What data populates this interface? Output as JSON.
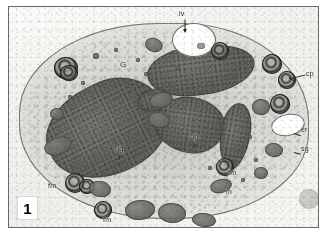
{
  "figure": {
    "number": "1",
    "type": "transmission-electron-micrograph",
    "caption_visible": false
  },
  "colors": {
    "plate_border": "#6a6a68",
    "background": "#ffffff",
    "label_text": "#1a1a18",
    "leader_line": "#24241f",
    "cytoplasm": "#bab8b2",
    "nucleus": "#605e5a",
    "vacuole": "#ffffff",
    "myelin_figure": "#2c2c2a"
  },
  "labels": [
    {
      "id": "lv",
      "text": "lv",
      "x": 178,
      "y": 9,
      "leader": "down",
      "meaning": "lucent-vacuole"
    },
    {
      "id": "G",
      "text": "G",
      "x": 118,
      "y": 60,
      "leader": "none",
      "meaning": "golgi"
    },
    {
      "id": "cp",
      "text": "cp",
      "x": 304,
      "y": 68,
      "leader": "left",
      "meaning": "cytoplasmic-process"
    },
    {
      "id": "er",
      "text": "er",
      "x": 299,
      "y": 124,
      "leader": "none",
      "meaning": "endoplasmic-reticulum"
    },
    {
      "id": "sg",
      "text": "sg",
      "x": 299,
      "y": 143,
      "leader": "none",
      "meaning": "secretory-granule"
    },
    {
      "id": "np",
      "text": "np",
      "x": 188,
      "y": 131,
      "leader": "none",
      "meaning": "nucleus-posterior-lobe"
    },
    {
      "id": "ng",
      "text": "ng",
      "x": 113,
      "y": 143,
      "leader": "none",
      "meaning": "nucleus-granular-lobe"
    },
    {
      "id": "fm1",
      "text": "fm",
      "x": 226,
      "y": 167,
      "leader": "none",
      "meaning": "myelin-figure"
    },
    {
      "id": "m",
      "text": "m",
      "x": 222,
      "y": 186,
      "leader": "none",
      "meaning": "mitochondrion"
    },
    {
      "id": "fm2",
      "text": "fm",
      "x": 46,
      "y": 180,
      "leader": "none",
      "meaning": "myelin-figure"
    },
    {
      "id": "fm3",
      "text": "fm",
      "x": 101,
      "y": 214,
      "leader": "none",
      "meaning": "myelin-figure"
    }
  ],
  "organelles": {
    "nucleus_lobes": [
      {
        "name": "ng-lobe",
        "cx": 105,
        "cy": 136,
        "rx": 62,
        "ry": 46,
        "rot": -28,
        "tone": "dark"
      },
      {
        "name": "np-lobe",
        "cx": 189,
        "cy": 126,
        "rx": 35,
        "ry": 28,
        "rot": 8,
        "tone": "dark"
      },
      {
        "name": "upper-lobe",
        "cx": 198,
        "cy": 68,
        "rx": 52,
        "ry": 24,
        "rot": -8,
        "tone": "dark"
      },
      {
        "name": "right-lobe",
        "cx": 232,
        "cy": 133,
        "rx": 14,
        "ry": 30,
        "rot": 10,
        "tone": "dark"
      }
    ],
    "vacuoles": [
      {
        "name": "lv-vacuole",
        "cx": 185,
        "cy": 33,
        "rx": 22,
        "ry": 17
      },
      {
        "name": "er-vacuole",
        "cx": 279,
        "cy": 118,
        "rx": 17,
        "ry": 11
      }
    ],
    "myelin_figures": [
      {
        "cx": 57,
        "cy": 62,
        "r": 12
      },
      {
        "cx": 211,
        "cy": 44,
        "r": 9
      },
      {
        "cx": 262,
        "cy": 57,
        "r": 10
      },
      {
        "cx": 278,
        "cy": 73,
        "r": 9
      },
      {
        "cx": 271,
        "cy": 97,
        "r": 10
      },
      {
        "cx": 66,
        "cy": 176,
        "r": 10
      },
      {
        "cx": 94,
        "cy": 203,
        "r": 9
      },
      {
        "cx": 216,
        "cy": 160,
        "r": 9
      }
    ],
    "mitochondria": [
      {
        "cx": 145,
        "cy": 38,
        "rx": 9,
        "ry": 7,
        "rot": 20
      },
      {
        "cx": 152,
        "cy": 93,
        "rx": 12,
        "ry": 8,
        "rot": -12
      },
      {
        "cx": 150,
        "cy": 113,
        "rx": 11,
        "ry": 8,
        "rot": 15
      },
      {
        "cx": 49,
        "cy": 139,
        "rx": 14,
        "ry": 9,
        "rot": -18
      },
      {
        "cx": 91,
        "cy": 182,
        "rx": 11,
        "ry": 8,
        "rot": 10
      },
      {
        "cx": 131,
        "cy": 203,
        "rx": 15,
        "ry": 10,
        "rot": -6
      },
      {
        "cx": 163,
        "cy": 206,
        "rx": 14,
        "ry": 10,
        "rot": 4
      },
      {
        "cx": 212,
        "cy": 179,
        "rx": 11,
        "ry": 7,
        "rot": -14
      },
      {
        "cx": 252,
        "cy": 166,
        "rx": 7,
        "ry": 6,
        "rot": 0
      },
      {
        "cx": 265,
        "cy": 143,
        "rx": 9,
        "ry": 7,
        "rot": 8
      },
      {
        "cx": 48,
        "cy": 107,
        "rx": 7,
        "ry": 6,
        "rot": 0
      },
      {
        "cx": 252,
        "cy": 100,
        "rx": 9,
        "ry": 8,
        "rot": 0
      }
    ],
    "granules": [
      {
        "cx": 86,
        "cy": 48,
        "r": 3
      },
      {
        "cx": 106,
        "cy": 42,
        "r": 2
      },
      {
        "cx": 128,
        "cy": 52,
        "r": 2
      },
      {
        "cx": 136,
        "cy": 66,
        "r": 2
      },
      {
        "cx": 120,
        "cy": 78,
        "r": 2
      },
      {
        "cx": 168,
        "cy": 60,
        "r": 2
      },
      {
        "cx": 240,
        "cy": 129,
        "r": 2
      },
      {
        "cx": 246,
        "cy": 152,
        "r": 2
      },
      {
        "cx": 233,
        "cy": 172,
        "r": 2
      },
      {
        "cx": 200,
        "cy": 160,
        "r": 2
      }
    ]
  }
}
